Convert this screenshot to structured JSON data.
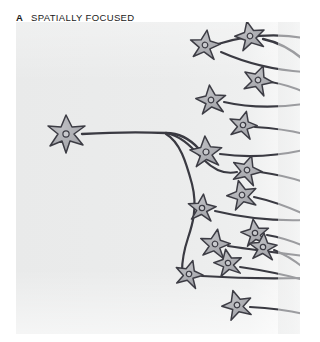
{
  "figure": {
    "panel_letter": "A",
    "title": "SPATIALLY FOCUSED",
    "colors": {
      "background_tint": "#ebecec",
      "background_fade": "#ffffff",
      "soma_fill": "#a9aaaf",
      "soma_outline": "#3c3c44",
      "nucleus_fill": "#c9cace",
      "nucleus_outline": "#3c3c44",
      "axon": "#3a3a42",
      "text": "#1a1a1a"
    },
    "diagram": {
      "type": "neural-connectivity-schematic",
      "description": "A single source neuron on the left projects one axon that branches into a small number of collaterals converging on a tight cluster of target neurons at the right, illustrating spatially focused divergence.",
      "source_neuron": {
        "label": "source-neuron",
        "cx": 50,
        "cy": 112,
        "radius": 19
      },
      "target_neurons": [
        {
          "cx": 189,
          "cy": 23,
          "radius": 15,
          "rot": 8
        },
        {
          "cx": 234,
          "cy": 14,
          "radius": 15,
          "rot": -12
        },
        {
          "cx": 242,
          "cy": 58,
          "radius": 15,
          "rot": 20
        },
        {
          "cx": 195,
          "cy": 78,
          "radius": 15,
          "rot": -6
        },
        {
          "cx": 227,
          "cy": 103,
          "radius": 14,
          "rot": 14
        },
        {
          "cx": 190,
          "cy": 130,
          "radius": 16,
          "rot": -4
        },
        {
          "cx": 231,
          "cy": 148,
          "radius": 15,
          "rot": 18
        },
        {
          "cx": 186,
          "cy": 186,
          "radius": 14,
          "rot": 6
        },
        {
          "cx": 226,
          "cy": 173,
          "radius": 15,
          "rot": -14
        },
        {
          "cx": 199,
          "cy": 222,
          "radius": 15,
          "rot": 10
        },
        {
          "cx": 239,
          "cy": 211,
          "radius": 14,
          "rot": -8
        },
        {
          "cx": 173,
          "cy": 252,
          "radius": 14,
          "rot": 16
        },
        {
          "cx": 212,
          "cy": 241,
          "radius": 14,
          "rot": -10
        },
        {
          "cx": 247,
          "cy": 225,
          "radius": 14,
          "rot": 4
        },
        {
          "cx": 221,
          "cy": 283,
          "radius": 15,
          "rot": -16
        }
      ],
      "axon_count": 15,
      "branch_count": 3
    }
  }
}
